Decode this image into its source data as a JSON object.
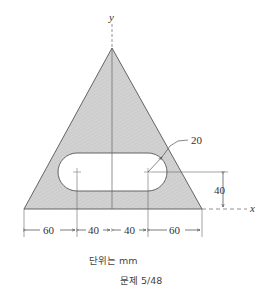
{
  "diagram": {
    "axes": {
      "x_label": "x",
      "y_label": "y"
    },
    "shape": "triangle with obround slot",
    "colors": {
      "fill": "#d4d4d4",
      "stroke": "#555555",
      "slot": "#ffffff"
    },
    "dimensions": {
      "slot_radius": "20",
      "slot_height": "40",
      "bottom": [
        "60",
        "40",
        "40",
        "60"
      ]
    },
    "units_note": "단위는 mm",
    "problem_label": "문제 5/48"
  }
}
